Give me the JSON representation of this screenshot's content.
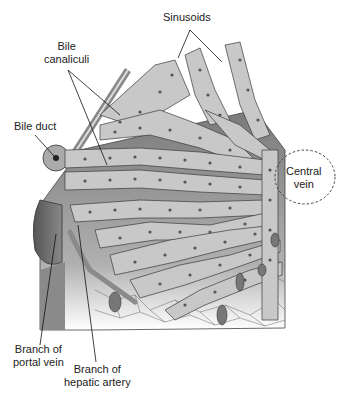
{
  "diagram": {
    "labels": {
      "sinusoids": "Sinusoids",
      "bile_canaliculi": "Bile canaliculi",
      "bile_canaliculi_line1": "Bile",
      "bile_canaliculi_line2": "canaliculi",
      "bile_duct": "Bile duct",
      "central_vein_line1": "Central",
      "central_vein_line2": "vein",
      "portal_vein_line1": "Branch of",
      "portal_vein_line2": "portal vein",
      "hepatic_artery_line1": "Branch of",
      "hepatic_artery_line2": "hepatic artery"
    },
    "colors": {
      "background": "#ffffff",
      "cell_fill": "#c8c8c8",
      "cell_stroke": "#3a3a3a",
      "nucleus": "#555555",
      "shadow": "#6e6e6e",
      "dark": "#4a4a4a",
      "text": "#222222"
    }
  }
}
